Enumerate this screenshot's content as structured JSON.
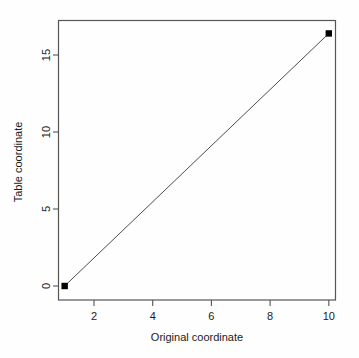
{
  "chart_data": {
    "type": "line",
    "title": "",
    "subtitle": "",
    "xlabel": "Original coordinate",
    "ylabel": "Table coordinate",
    "x": [
      1,
      10
    ],
    "values": [
      0,
      16.4
    ],
    "series": [
      {
        "name": "coordinate mapping",
        "x": [
          1,
          10
        ],
        "values": [
          0,
          16.4
        ]
      }
    ],
    "xlim": [
      0.7,
      10.3
    ],
    "ylim": [
      -0.6,
      17.4
    ],
    "xticks": [
      2,
      4,
      6,
      8,
      10
    ],
    "xtick_labels": [
      "2",
      "4",
      "6",
      "8",
      "10"
    ],
    "yticks": [
      0,
      5,
      10,
      15
    ],
    "ytick_labels": [
      "0",
      "5",
      "10",
      "15"
    ],
    "grid": false,
    "legend": false,
    "legend_position": "none",
    "marker": "filled-square",
    "line_color": "#4d4d4d",
    "marker_color": "#000000",
    "box_color": "#555555",
    "background_color": "#fefefe",
    "annotations": []
  }
}
